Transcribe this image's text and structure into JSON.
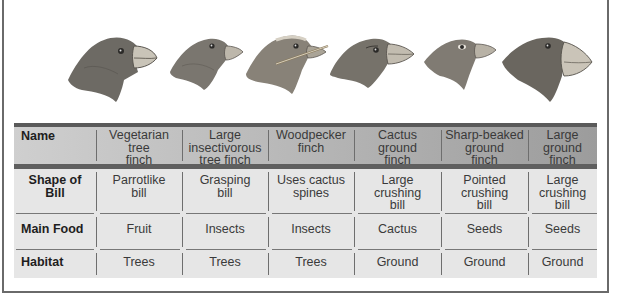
{
  "figure": {
    "birds": [
      {
        "name": "vegetarian-tree-finch",
        "bill": "parrotlike"
      },
      {
        "name": "large-insectivorous-tree-finch",
        "bill": "grasping"
      },
      {
        "name": "woodpecker-finch",
        "bill": "cactus-spine"
      },
      {
        "name": "cactus-ground-finch",
        "bill": "large-crushing"
      },
      {
        "name": "sharp-beaked-ground-finch",
        "bill": "pointed-crushing"
      },
      {
        "name": "large-ground-finch",
        "bill": "large-crushing"
      }
    ]
  },
  "table": {
    "header": {
      "label": "Name",
      "columns": [
        "Vegetarian\ntree\nfinch",
        "Large\ninsectivorous\ntree finch",
        "Woodpecker\nfinch",
        "Cactus\nground\nfinch",
        "Sharp-beaked\nground\nfinch",
        "Large\nground\nfinch"
      ]
    },
    "rows": [
      {
        "label": "Shape of\nBill",
        "values": [
          "Parrotlike\nbill",
          "Grasping\nbill",
          "Uses cactus\nspines",
          "Large\ncrushing\nbill",
          "Pointed\ncrushing\nbill",
          "Large\ncrushing\nbill"
        ]
      },
      {
        "label": "Main Food",
        "values": [
          "Fruit",
          "Insects",
          "Insects",
          "Cactus",
          "Seeds",
          "Seeds"
        ]
      },
      {
        "label": "Habitat",
        "values": [
          "Trees",
          "Trees",
          "Trees",
          "Ground",
          "Ground",
          "Ground"
        ]
      }
    ]
  },
  "colors": {
    "header_left": "#cfcfcf",
    "header_right": "#9c9c9c",
    "bar": "#5a5a5a",
    "body": "#e6e6e6",
    "frame": "#6a6a6a"
  }
}
